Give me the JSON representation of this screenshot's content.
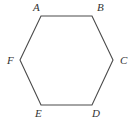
{
  "figure": {
    "name": "hexagon",
    "shape_type": "regular-hexagon",
    "background_color": "#ffffff",
    "stroke_color": "#4a4a4a",
    "stroke_width": 1.1,
    "fill": "none",
    "label_color": "#333333",
    "label_style": "italic-serif",
    "label_font_size": 11,
    "canvas": {
      "width": 133,
      "height": 122
    },
    "polygon_points": "41,16 92,16 113,60 92,105 41,105 20,60",
    "vertices": [
      {
        "label": "A",
        "x": 41,
        "y": 16,
        "label_x": 33,
        "label_y": 2,
        "position": "top-left"
      },
      {
        "label": "B",
        "x": 92,
        "y": 16,
        "label_x": 97,
        "label_y": 2,
        "position": "top-right"
      },
      {
        "label": "C",
        "x": 113,
        "y": 60,
        "label_x": 120,
        "label_y": 55,
        "position": "right"
      },
      {
        "label": "D",
        "x": 92,
        "y": 105,
        "label_x": 92,
        "label_y": 108,
        "position": "bottom-right"
      },
      {
        "label": "E",
        "x": 41,
        "y": 105,
        "label_x": 35,
        "label_y": 108,
        "position": "bottom-left"
      },
      {
        "label": "F",
        "x": 20,
        "y": 60,
        "label_x": 7,
        "label_y": 55,
        "position": "left"
      }
    ],
    "edges": [
      {
        "from": "A",
        "to": "B"
      },
      {
        "from": "B",
        "to": "C"
      },
      {
        "from": "C",
        "to": "D"
      },
      {
        "from": "D",
        "to": "E"
      },
      {
        "from": "E",
        "to": "F"
      },
      {
        "from": "F",
        "to": "A"
      }
    ]
  }
}
